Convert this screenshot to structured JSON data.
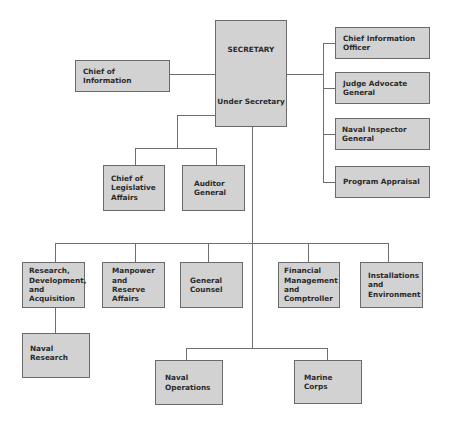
{
  "chart": {
    "top": {
      "secretary": "SECRETARY",
      "under_secretary": "Under Secretary"
    },
    "left_staff": {
      "chief_of_information": "Chief of Information"
    },
    "right_staff": [
      {
        "line1": "Chief Information",
        "line2": "Officer"
      },
      {
        "line1": "Judge Advocate",
        "line2": "General"
      },
      {
        "line1": "Naval Inspector General",
        "line2": ""
      },
      {
        "line1": "Program Appraisal",
        "line2": ""
      }
    ],
    "under_secretary_staff": [
      {
        "lines": [
          "Chief of",
          "Legislative",
          "Affairs"
        ]
      },
      {
        "lines": [
          "Auditor",
          "General"
        ]
      }
    ],
    "assistant_secretaries": [
      {
        "lines": [
          "Research,",
          "Development,",
          "and",
          "Acquisition"
        ]
      },
      {
        "lines": [
          "Manpower",
          "and Reserve",
          "Affairs"
        ]
      },
      {
        "lines": [
          "General",
          "Counsel"
        ]
      },
      {
        "lines": [
          "Financial",
          "Management",
          "and",
          "Comptroller"
        ]
      },
      {
        "lines": [
          "Installations",
          "and",
          "Environment"
        ]
      }
    ],
    "subordinate": {
      "lines": [
        "Naval",
        "Research"
      ]
    },
    "operating_forces": [
      {
        "lines": [
          "Naval",
          "Operations"
        ]
      },
      {
        "lines": [
          "Marine Corps"
        ]
      }
    ]
  },
  "colors": {
    "box_fill": "#d2d2d2",
    "box_border": "#6a6a6a",
    "line": "#6f6f6f",
    "text": "#2a2a2a"
  }
}
